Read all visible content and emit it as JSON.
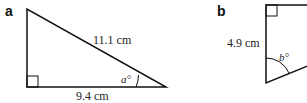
{
  "figures": [
    {
      "id": "a",
      "label": "a",
      "hypotenuse_label": "11.1 cm",
      "base_label": "9.4 cm",
      "angle_label": "a°"
    },
    {
      "id": "b",
      "label": "b",
      "side_label": "4.9 cm",
      "angle_label": "b°"
    }
  ]
}
